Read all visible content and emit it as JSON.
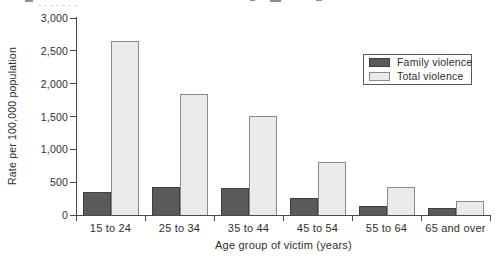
{
  "chart_data": {
    "type": "bar",
    "categories": [
      "15 to 24",
      "25 to 34",
      "35 to 44",
      "45 to 54",
      "55 to 64",
      "65 and over"
    ],
    "series": [
      {
        "name": "Family violence",
        "color": "#5a5a5c",
        "border": "#3f3f41",
        "values": [
          350,
          430,
          410,
          260,
          130,
          100
        ]
      },
      {
        "name": "Total violence",
        "color": "#eaeae8",
        "border": "#8a8a88",
        "values": [
          2650,
          1850,
          1500,
          800,
          430,
          210
        ]
      }
    ],
    "title": "",
    "xlabel": "Age group of victim (years)",
    "ylabel": "Rate per 100,000 population",
    "ylim": [
      0,
      3000
    ],
    "ytick_step": 500,
    "ytick_labels": [
      "3,000",
      "2,500",
      "2,000",
      "1,500",
      "1,000",
      "500",
      "0"
    ],
    "grid": "off",
    "legend_position": "upper-right-inside"
  },
  "colors": {
    "axis": "#4a4a4a",
    "text": "#2e2e2e",
    "background": "#fffffe"
  }
}
